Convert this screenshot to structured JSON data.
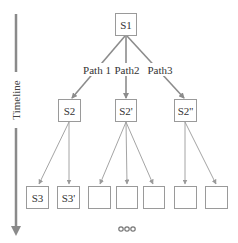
{
  "diagram": {
    "timeline": {
      "label": "Timeline",
      "color": "#8a8a8a"
    },
    "root": {
      "label": "S1"
    },
    "paths": [
      {
        "label": "Path 1"
      },
      {
        "label": "Path2"
      },
      {
        "label": "Path3"
      }
    ],
    "level2": [
      {
        "label": "S2"
      },
      {
        "label": "S2'"
      },
      {
        "label": "S2''"
      }
    ],
    "level3": [
      {
        "label": "S3"
      },
      {
        "label": "S3'"
      },
      {
        "label": ""
      },
      {
        "label": ""
      },
      {
        "label": ""
      },
      {
        "label": ""
      },
      {
        "label": ""
      }
    ],
    "ellipsis": "•••",
    "colors": {
      "edge_thick": "#8c8c8c",
      "edge_thin": "#9a9a9a",
      "box_border": "#9a9a9a",
      "text": "#333333"
    }
  }
}
